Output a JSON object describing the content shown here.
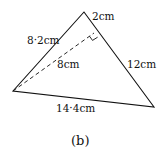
{
  "figure": {
    "caption": "(b)",
    "vertices": {
      "top": [
        84,
        12
      ],
      "left": [
        13,
        91
      ],
      "right": [
        154,
        107
      ],
      "foot": [
        94,
        33
      ]
    },
    "labels": {
      "left_side": "8·2cm",
      "top_segment": "2cm",
      "right_side": "12cm",
      "bottom_side": "14·4cm",
      "height": "8cm"
    },
    "colors": {
      "stroke": "#111111",
      "background": "#ffffff"
    }
  }
}
